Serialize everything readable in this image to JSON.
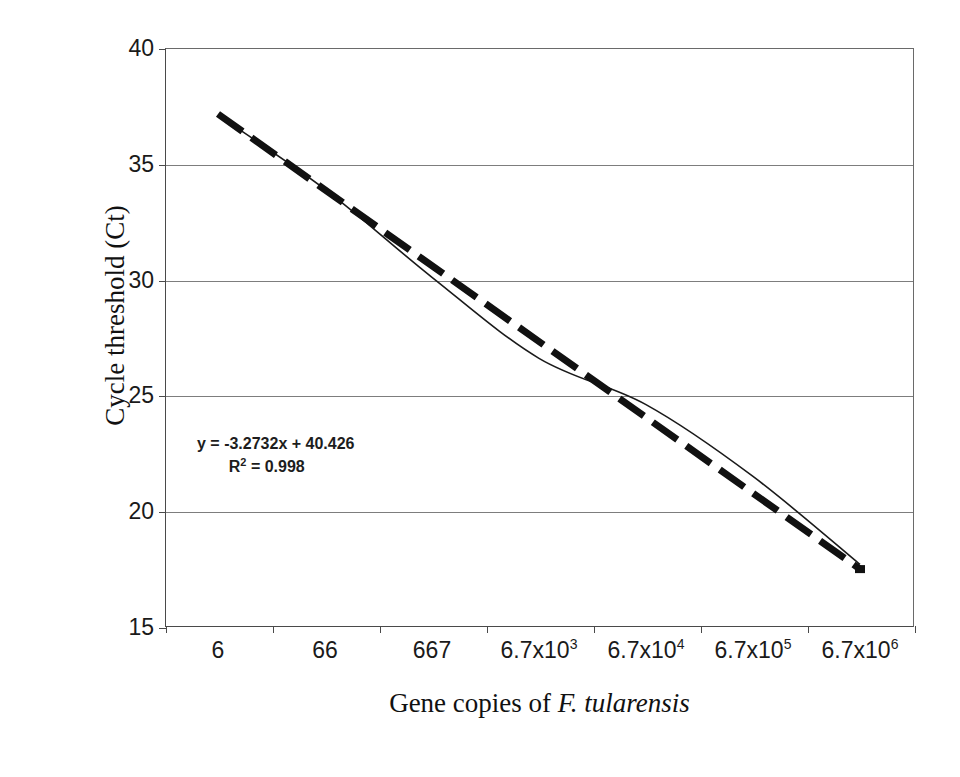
{
  "chart_data": {
    "type": "line",
    "title": "",
    "xlabel": "Gene copies of F. tularensis",
    "xlabel_plain": "Gene copies of ",
    "xlabel_species": "F. tularensis",
    "ylabel": "Cycle threshold (Ct)",
    "categories": [
      "6",
      "66",
      "667",
      "6.7x10^3",
      "6.7x10^4",
      "6.7x10^5",
      "6.7x10^6"
    ],
    "category_labels": [
      {
        "base": "6",
        "exp": ""
      },
      {
        "base": "66",
        "exp": ""
      },
      {
        "base": "667",
        "exp": ""
      },
      {
        "base": "6.7x10",
        "exp": "3"
      },
      {
        "base": "6.7x10",
        "exp": "4"
      },
      {
        "base": "6.7x10",
        "exp": "5"
      },
      {
        "base": "6.7x10",
        "exp": "6"
      }
    ],
    "x_numeric": [
      6,
      66,
      667,
      6700,
      67000,
      670000,
      6700000
    ],
    "ylim": [
      15,
      40
    ],
    "yticks": [
      40,
      35,
      30,
      25,
      20,
      15
    ],
    "ytick_labels": [
      "40",
      "35",
      "30",
      "25",
      "20",
      "15"
    ],
    "grid": true,
    "grid_axis": "y",
    "legend": "none",
    "series": [
      {
        "name": "Measured Ct",
        "style": "solid-thin",
        "color": "#1a1a1a",
        "values": [
          37.1,
          33.9,
          30.1,
          26.6,
          24.6,
          21.5,
          17.7
        ]
      },
      {
        "name": "Linear trendline",
        "style": "dashed-thick",
        "color": "#111111",
        "values": [
          37.15,
          33.9,
          30.6,
          27.3,
          24.0,
          20.8,
          17.5
        ]
      }
    ],
    "annotations": [
      {
        "text": "y = -3.2732x + 40.426",
        "slope": -3.2732,
        "intercept": 40.426
      },
      {
        "text": "R2 = 0.998",
        "r_squared": 0.998,
        "label": "R",
        "exp": "2",
        "value": "= 0.998"
      }
    ]
  },
  "axes": {
    "y_title": "Cycle threshold (Ct)",
    "x_title_prefix": "Gene copies of ",
    "x_title_species": "F. tularensis"
  },
  "annotation": {
    "equation": "y = -3.2732x + 40.426",
    "r2_prefix": "R",
    "r2_exp": "2",
    "r2_value": "= 0.998"
  },
  "artifact": {
    "text": ". . . . . . . . . . . . . . . . . ."
  }
}
